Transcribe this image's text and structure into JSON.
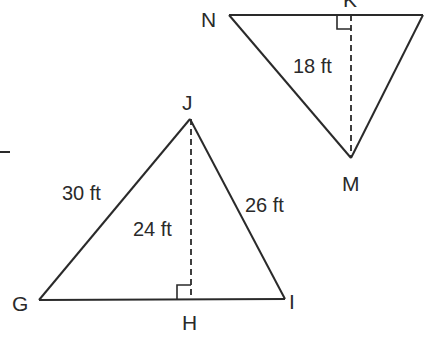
{
  "diagram": {
    "colors": {
      "line": "#2a2a2a",
      "background": "#ffffff"
    },
    "triangle_nkm": {
      "vertices": [
        {
          "name": "N",
          "label": "N"
        },
        {
          "name": "K",
          "label": "K"
        },
        {
          "name": "M",
          "label": "M"
        }
      ],
      "altitude_label": "18 ft"
    },
    "triangle_gji": {
      "vertices": [
        {
          "name": "G",
          "label": "G"
        },
        {
          "name": "J",
          "label": "J"
        },
        {
          "name": "I",
          "label": "I"
        },
        {
          "name": "H",
          "label": "H"
        }
      ],
      "side_gj_label": "30 ft",
      "side_ji_label": "26 ft",
      "altitude_label": "24 ft"
    }
  }
}
